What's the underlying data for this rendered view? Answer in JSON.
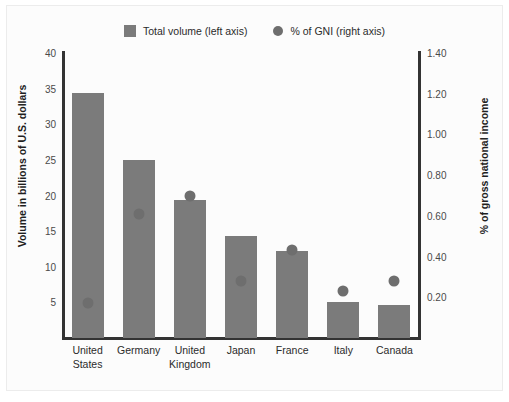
{
  "chart_data": {
    "type": "bar",
    "title": "",
    "subtitle": "",
    "categories": [
      "United States",
      "Germany",
      "United Kingdom",
      "Japan",
      "France",
      "Italy",
      "Canada"
    ],
    "category_lines": [
      [
        "United",
        "States"
      ],
      [
        "Germany"
      ],
      [
        "United",
        "Kingdom"
      ],
      [
        "Japan"
      ],
      [
        "France"
      ],
      [
        "Italy"
      ],
      [
        "Canada"
      ]
    ],
    "series": [
      {
        "name": "Total volume (left axis)",
        "axis": "left",
        "mark": "bar",
        "color": "#7b7b7b",
        "values": [
          34.4,
          25.0,
          19.4,
          14.3,
          12.2,
          5.0,
          4.7
        ]
      },
      {
        "name": "% of GNI (right axis)",
        "axis": "right",
        "mark": "dot",
        "color": "#6e6e6e",
        "values": [
          0.17,
          0.61,
          0.7,
          0.28,
          0.43,
          0.23,
          0.28
        ]
      }
    ],
    "xlabel": "",
    "ylabel": "Volume in billions of U.S. dollars",
    "y2label": "% of gross national income",
    "ylim": [
      0,
      40
    ],
    "y2lim": [
      0,
      1.4
    ],
    "yticks": [
      5,
      10,
      15,
      20,
      25,
      30,
      35,
      40
    ],
    "ytick_labels": [
      "5",
      "10",
      "15",
      "20",
      "25",
      "30",
      "35",
      "40"
    ],
    "y2ticks": [
      0.2,
      0.4,
      0.6,
      0.8,
      1.0,
      1.2,
      1.4
    ],
    "y2tick_labels": [
      "0.20",
      "0.40",
      "0.60",
      "0.80",
      "1.00",
      "1.20",
      "1.40"
    ],
    "grid": false,
    "legend_position": "top-center"
  },
  "legend": {
    "items": [
      {
        "label": "Total volume (left axis)",
        "marker": "square-swatch"
      },
      {
        "label": "% of GNI (right axis)",
        "marker": "circle-swatch"
      }
    ]
  },
  "colors": {
    "bar": "#7b7b7b",
    "dot": "#6e6e6e",
    "axis": "#333333",
    "text": "#2b2b2b",
    "tick_text": "#4a4a4a",
    "background": "#fcfcfc",
    "page": "#ffffff"
  }
}
